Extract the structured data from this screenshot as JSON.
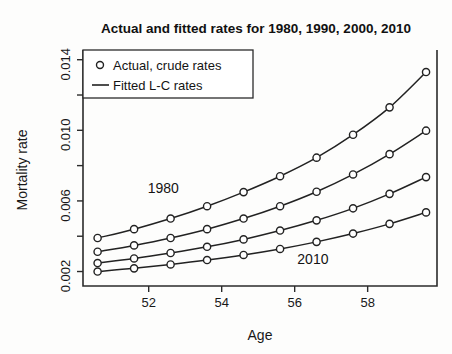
{
  "figure": {
    "title": "Actual and fitted rates for 1980, 1990, 2000, 2010",
    "background_color": "#fdfdfc",
    "ink_color": "#222222"
  },
  "axes": {
    "x_label": "Age",
    "y_label": "Mortality rate",
    "x_ticks": [
      "52",
      "54",
      "56",
      "58"
    ],
    "y_ticks": [
      "0.002",
      "0.006",
      "0.010",
      "0.014"
    ]
  },
  "legend": {
    "items": [
      {
        "label": "Actual, crude rates",
        "marker": "circle-open"
      },
      {
        "label": "Fitted L-C rates",
        "marker": "line"
      }
    ]
  },
  "annotations": [
    {
      "text": "1980",
      "x": 52.4,
      "y": 0.00645
    },
    {
      "text": "2010",
      "x": 56.5,
      "y": 0.00245
    }
  ],
  "chart_data": {
    "type": "line",
    "title": "Actual and fitted rates for 1980, 1990, 2000, 2010",
    "xlabel": "Age",
    "ylabel": "Mortality rate",
    "xlim": [
      50.2,
      59.9
    ],
    "ylim": [
      0.00118,
      0.01455
    ],
    "grid": false,
    "legend_position": "top-left",
    "x": [
      50.6,
      51.6,
      52.6,
      53.6,
      54.6,
      55.6,
      56.6,
      57.6,
      58.6,
      59.6
    ],
    "series": [
      {
        "name": "1980",
        "marker": "circle-open",
        "line": "solid",
        "values": [
          0.0039,
          0.0044,
          0.005,
          0.0057,
          0.0065,
          0.0074,
          0.00845,
          0.00975,
          0.0113,
          0.0133
        ]
      },
      {
        "name": "1990",
        "marker": "circle-open",
        "line": "solid",
        "values": [
          0.00312,
          0.00348,
          0.0039,
          0.0044,
          0.005,
          0.0057,
          0.00652,
          0.0075,
          0.00865,
          0.00998
        ]
      },
      {
        "name": "2000",
        "marker": "circle-open",
        "line": "solid",
        "values": [
          0.00248,
          0.00274,
          0.00305,
          0.0034,
          0.00382,
          0.00432,
          0.0049,
          0.00558,
          0.0064,
          0.00735
        ]
      },
      {
        "name": "2010",
        "marker": "circle-open",
        "line": "solid",
        "values": [
          0.002,
          0.00218,
          0.0024,
          0.00265,
          0.00294,
          0.00328,
          0.00368,
          0.00415,
          0.0047,
          0.00535
        ]
      }
    ]
  }
}
